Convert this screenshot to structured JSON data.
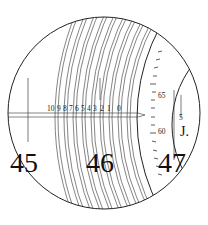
{
  "diagram": {
    "colors": {
      "line": "#222222",
      "bg": "#ffffff",
      "ink": "#111111"
    },
    "main_scale": {
      "degree_labels": [
        "45",
        "46",
        "47"
      ]
    },
    "micrometer_scale": {
      "labels": [
        "10",
        "9",
        "8",
        "7",
        "6",
        "5",
        "4",
        "3",
        "2",
        "1",
        "0"
      ]
    },
    "vertical_scale": {
      "labels": [
        "65",
        "60",
        "5"
      ]
    },
    "index_mark": "J."
  }
}
